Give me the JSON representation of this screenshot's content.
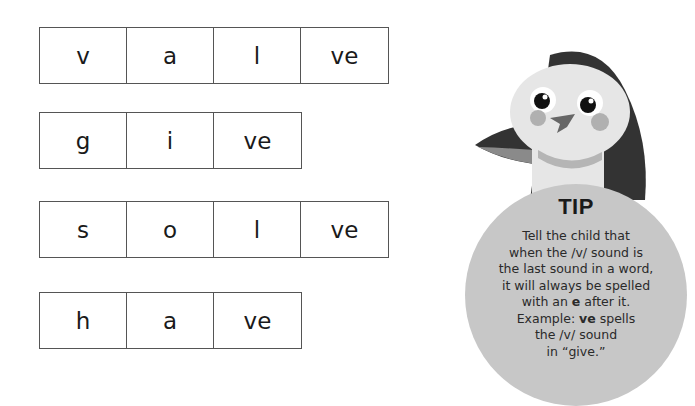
{
  "words": [
    {
      "word": "valve",
      "cells": [
        "v",
        "a",
        "l",
        "ve"
      ]
    },
    {
      "word": "give",
      "cells": [
        "g",
        "i",
        "ve"
      ]
    },
    {
      "word": "solve",
      "cells": [
        "s",
        "o",
        "l",
        "ve"
      ]
    },
    {
      "word": "have",
      "cells": [
        "h",
        "a",
        "ve"
      ]
    }
  ],
  "tip": {
    "title": "TIP",
    "lines": [
      "Tell the child that",
      "when the /v/ sound is",
      "the last sound in a word,",
      "it will always be spelled",
      [
        "with an ",
        "e",
        " after it."
      ],
      [
        "Example: ",
        "ve",
        " spells"
      ],
      "the /v/ sound",
      "in “give.”"
    ],
    "line1": "Tell the child that",
    "line2": "when the /v/ sound is",
    "line3": "the last sound in a word,",
    "line4": "it will always be spelled",
    "line5_pre": "with an ",
    "line5_bold": "e",
    "line5_post": " after it.",
    "line6_pre": "Example: ",
    "line6_bold": "ve",
    "line6_post": " spells",
    "line7": "the /v/ sound",
    "line8": "in “give.”"
  },
  "mascot": {
    "name": "penguin-mascot"
  },
  "colors": {
    "box_border": "#555555",
    "tip_bg": "#c7c7c7",
    "penguin_dark": "#333333",
    "penguin_light": "#e8e8e8"
  }
}
